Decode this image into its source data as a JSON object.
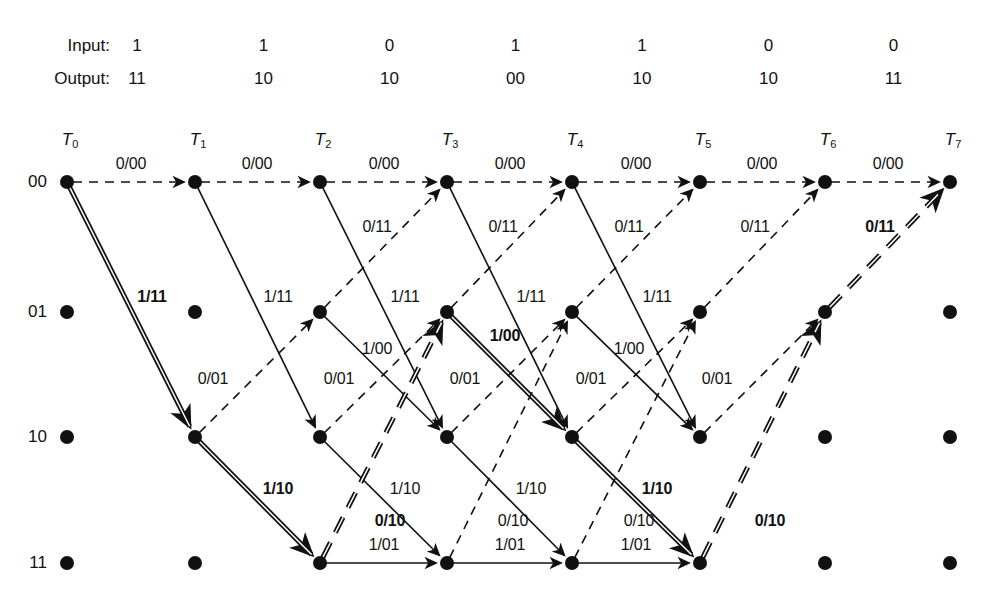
{
  "header": {
    "input_label": "Input:",
    "output_label": "Output:",
    "inputs": [
      "1",
      "1",
      "0",
      "1",
      "1",
      "0",
      "0"
    ],
    "outputs": [
      "11",
      "10",
      "10",
      "00",
      "10",
      "10",
      "11"
    ]
  },
  "time_axis": {
    "prefix": "T",
    "indices": [
      "0",
      "1",
      "2",
      "3",
      "4",
      "5",
      "6",
      "7"
    ],
    "x": [
      67,
      195,
      320,
      447,
      572,
      700,
      825,
      950
    ],
    "y": 130
  },
  "states": {
    "labels": [
      "00",
      "01",
      "10",
      "11"
    ],
    "y": [
      182,
      312,
      437,
      563
    ],
    "label_x": 47
  },
  "style": {
    "ink": "#111111",
    "background": "#ffffff",
    "node_radius": 7,
    "thin_width": 1.6,
    "bold_width": 5.0
  },
  "chart_data": {
    "type": "diagram",
    "columns": 8,
    "rows": 4,
    "edge_convention": {
      "solid": "input 1",
      "dashed": "input 0",
      "label_format": "input/output"
    },
    "edges": [
      {
        "t": 0,
        "from": "00",
        "to": "00",
        "label": "0/00",
        "style": "dashed",
        "weight": "thin",
        "lx": 131,
        "ly": 164
      },
      {
        "t": 0,
        "from": "00",
        "to": "10",
        "label": "1/11",
        "style": "solid",
        "weight": "double",
        "lx": 152,
        "ly": 297
      },
      {
        "t": 1,
        "from": "00",
        "to": "00",
        "label": "0/00",
        "style": "dashed",
        "weight": "thin",
        "lx": 257,
        "ly": 164
      },
      {
        "t": 1,
        "from": "00",
        "to": "10",
        "label": "1/11",
        "style": "solid",
        "weight": "thin",
        "lx": 278,
        "ly": 297
      },
      {
        "t": 1,
        "from": "10",
        "to": "01",
        "label": "0/01",
        "style": "dashed",
        "weight": "thin",
        "lx": 213,
        "ly": 379
      },
      {
        "t": 1,
        "from": "10",
        "to": "11",
        "label": "1/10",
        "style": "solid",
        "weight": "double",
        "lx": 278,
        "ly": 489
      },
      {
        "t": 2,
        "from": "00",
        "to": "00",
        "label": "0/00",
        "style": "dashed",
        "weight": "thin",
        "lx": 384,
        "ly": 164
      },
      {
        "t": 2,
        "from": "00",
        "to": "10",
        "label": "1/11",
        "style": "solid",
        "weight": "thin",
        "lx": 405,
        "ly": 297
      },
      {
        "t": 2,
        "from": "01",
        "to": "00",
        "label": "0/11",
        "style": "dashed",
        "weight": "thin",
        "lx": 377,
        "ly": 227
      },
      {
        "t": 2,
        "from": "01",
        "to": "10",
        "label": "1/00",
        "style": "solid",
        "weight": "thin",
        "lx": 377,
        "ly": 349
      },
      {
        "t": 2,
        "from": "10",
        "to": "01",
        "label": "0/01",
        "style": "dashed",
        "weight": "thin",
        "lx": 339,
        "ly": 379
      },
      {
        "t": 2,
        "from": "10",
        "to": "11",
        "label": "1/10",
        "style": "solid",
        "weight": "thin",
        "lx": 405,
        "ly": 489
      },
      {
        "t": 2,
        "from": "11",
        "to": "01",
        "label": "0/10",
        "style": "dashed",
        "weight": "double",
        "lx": 390,
        "ly": 521
      },
      {
        "t": 2,
        "from": "11",
        "to": "11",
        "label": "1/01",
        "style": "solid",
        "weight": "thin",
        "lx": 384,
        "ly": 545
      },
      {
        "t": 3,
        "from": "00",
        "to": "00",
        "label": "0/00",
        "style": "dashed",
        "weight": "thin",
        "lx": 510,
        "ly": 164
      },
      {
        "t": 3,
        "from": "00",
        "to": "10",
        "label": "1/11",
        "style": "solid",
        "weight": "thin",
        "lx": 531,
        "ly": 297
      },
      {
        "t": 3,
        "from": "01",
        "to": "00",
        "label": "0/11",
        "style": "dashed",
        "weight": "thin",
        "lx": 503,
        "ly": 227
      },
      {
        "t": 3,
        "from": "01",
        "to": "10",
        "label": "1/00",
        "style": "solid",
        "weight": "double",
        "lx": 505,
        "ly": 336
      },
      {
        "t": 3,
        "from": "10",
        "to": "01",
        "label": "0/01",
        "style": "dashed",
        "weight": "thin",
        "lx": 465,
        "ly": 379
      },
      {
        "t": 3,
        "from": "10",
        "to": "11",
        "label": "1/10",
        "style": "solid",
        "weight": "thin",
        "lx": 531,
        "ly": 489
      },
      {
        "t": 3,
        "from": "11",
        "to": "01",
        "label": "0/10",
        "style": "dashed",
        "weight": "thin",
        "lx": 513,
        "ly": 521
      },
      {
        "t": 3,
        "from": "11",
        "to": "11",
        "label": "1/01",
        "style": "solid",
        "weight": "thin",
        "lx": 510,
        "ly": 545
      },
      {
        "t": 4,
        "from": "00",
        "to": "00",
        "label": "0/00",
        "style": "dashed",
        "weight": "thin",
        "lx": 636,
        "ly": 164
      },
      {
        "t": 4,
        "from": "00",
        "to": "10",
        "label": "1/11",
        "style": "solid",
        "weight": "thin",
        "lx": 657,
        "ly": 297
      },
      {
        "t": 4,
        "from": "01",
        "to": "00",
        "label": "0/11",
        "style": "dashed",
        "weight": "thin",
        "lx": 629,
        "ly": 227
      },
      {
        "t": 4,
        "from": "01",
        "to": "10",
        "label": "1/00",
        "style": "solid",
        "weight": "thin",
        "lx": 629,
        "ly": 349
      },
      {
        "t": 4,
        "from": "10",
        "to": "01",
        "label": "0/01",
        "style": "dashed",
        "weight": "thin",
        "lx": 591,
        "ly": 379
      },
      {
        "t": 4,
        "from": "10",
        "to": "11",
        "label": "1/10",
        "style": "solid",
        "weight": "double",
        "lx": 657,
        "ly": 489
      },
      {
        "t": 4,
        "from": "11",
        "to": "01",
        "label": "0/10",
        "style": "dashed",
        "weight": "thin",
        "lx": 639,
        "ly": 521
      },
      {
        "t": 4,
        "from": "11",
        "to": "11",
        "label": "1/01",
        "style": "solid",
        "weight": "thin",
        "lx": 636,
        "ly": 545
      },
      {
        "t": 5,
        "from": "00",
        "to": "00",
        "label": "0/00",
        "style": "dashed",
        "weight": "thin",
        "lx": 762,
        "ly": 164
      },
      {
        "t": 5,
        "from": "01",
        "to": "00",
        "label": "0/11",
        "style": "dashed",
        "weight": "thin",
        "lx": 755,
        "ly": 227
      },
      {
        "t": 5,
        "from": "10",
        "to": "01",
        "label": "0/01",
        "style": "dashed",
        "weight": "thin",
        "lx": 717,
        "ly": 379
      },
      {
        "t": 5,
        "from": "11",
        "to": "01",
        "label": "0/10",
        "style": "dashed",
        "weight": "double",
        "lx": 770,
        "ly": 521
      },
      {
        "t": 6,
        "from": "00",
        "to": "00",
        "label": "0/00",
        "style": "dashed",
        "weight": "thin",
        "lx": 888,
        "ly": 164
      },
      {
        "t": 6,
        "from": "01",
        "to": "00",
        "label": "0/11",
        "style": "dashed",
        "weight": "double",
        "lx": 880,
        "ly": 227
      }
    ],
    "survivor_path": [
      "00",
      "10",
      "11",
      "01",
      "10",
      "11",
      "01",
      "00"
    ],
    "survivor_labels": [
      "1/11",
      "1/10",
      "0/10",
      "1/00",
      "1/10",
      "0/10",
      "0/11"
    ]
  }
}
